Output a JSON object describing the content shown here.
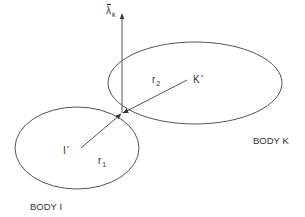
{
  "diagram": {
    "colors": {
      "stroke": "#555555",
      "text": "#333333",
      "background": "#ffffff"
    },
    "contact_point": {
      "x": 122,
      "y": 113
    },
    "bodies": [
      {
        "id": "K",
        "label": "BODY K",
        "center_label": "K",
        "center_mark": "*",
        "radius_label": "r",
        "radius_sub": "2",
        "ellipse": {
          "cx": 195,
          "cy": 83,
          "rx": 87,
          "ry": 41
        },
        "center": {
          "x": 187,
          "y": 80
        }
      },
      {
        "id": "I",
        "label": "BODY I",
        "center_label": "I",
        "center_mark": "*",
        "radius_label": "r",
        "radius_sub": "1",
        "ellipse": {
          "cx": 77,
          "cy": 148,
          "rx": 62,
          "ry": 41
        },
        "center": {
          "x": 81,
          "y": 148
        }
      }
    ],
    "normal_vector": {
      "symbol": "λ",
      "sub": "k",
      "overbar": true,
      "from": {
        "x": 122,
        "y": 113
      },
      "to": {
        "x": 122,
        "y": 14
      }
    }
  }
}
